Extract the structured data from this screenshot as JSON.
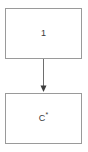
{
  "diagram": {
    "type": "flowchart",
    "orientation": "vertical",
    "canvas": {
      "width": 88,
      "height": 152,
      "background": "#ffffff"
    },
    "colors": {
      "node_border": "#9a9a9a",
      "node_fill": "#ffffff",
      "text": "#3a3a3a",
      "edge": "#6e6e6e"
    },
    "nodes": [
      {
        "id": "node-top",
        "label": "1",
        "label_base": "1",
        "label_superscript": "",
        "shape": "rectangle",
        "x": 5,
        "y": 8,
        "width": 77,
        "height": 51
      },
      {
        "id": "node-bottom",
        "label": "C*",
        "label_base": "C",
        "label_superscript": "*",
        "shape": "rectangle",
        "x": 5,
        "y": 93,
        "width": 77,
        "height": 51
      }
    ],
    "edges": [
      {
        "id": "edge-top-to-bottom",
        "from": "node-top",
        "to": "node-bottom",
        "label": "",
        "arrowhead": "solid-triangle",
        "direction": "down",
        "x": 43.5,
        "y_start": 59,
        "y_end": 92
      }
    ]
  }
}
